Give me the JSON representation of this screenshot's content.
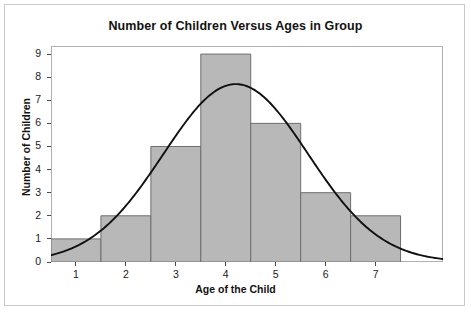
{
  "chart_data": {
    "type": "bar",
    "title": "Number of Children Versus Ages in Group",
    "xlabel": "Age of the Child",
    "ylabel": "Number of Children",
    "categories": [
      "1",
      "2",
      "3",
      "4",
      "5",
      "6",
      "7"
    ],
    "values": [
      1,
      2,
      5,
      9,
      6,
      3,
      2
    ],
    "x": [
      1,
      2,
      3,
      4,
      5,
      6,
      7
    ],
    "bar_width": 1,
    "xlim": [
      0.5,
      8.35
    ],
    "ylim": [
      0,
      9.35
    ],
    "xticks": [
      "1",
      "2",
      "3",
      "4",
      "5",
      "6",
      "7"
    ],
    "yticks": [
      "0",
      "1",
      "2",
      "3",
      "4",
      "5",
      "6",
      "7",
      "8",
      "9"
    ],
    "grid": false,
    "legend": null,
    "bar_color": "#b8b8b8",
    "bar_edge_color": "#6e6e6e",
    "overlay": {
      "type": "line",
      "name": "normal-curve",
      "color": "#101010",
      "peak_x": 4.2,
      "peak_y": 7.7,
      "mean": 4.2,
      "stdev": 1.45
    }
  },
  "page": {
    "title": "Number of Children Versus Ages in Group",
    "axis": {
      "y_title": "Number of Children",
      "x_title": "Age of the Child",
      "y_ticks": [
        "9",
        "8",
        "7",
        "6",
        "5",
        "4",
        "3",
        "2",
        "1",
        "0"
      ],
      "x_ticks": [
        "1",
        "2",
        "3",
        "4",
        "5",
        "6",
        "7"
      ]
    }
  }
}
